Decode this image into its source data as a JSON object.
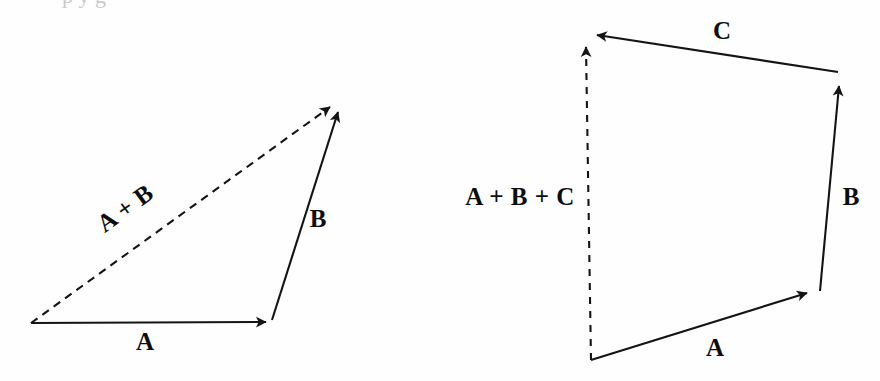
{
  "figure": {
    "width": 880,
    "height": 381,
    "background_color": "#fefefe",
    "ink_color": "#141414",
    "cropped_caption_fragment": "p                  y      g"
  },
  "diagrams": [
    {
      "id": "triangle-sum",
      "name": "two-vector-addition-triangle",
      "description": "Triangle showing head-to-tail addition of vectors A and B with resultant A + B shown as a dashed arrow",
      "vectors": [
        {
          "label": "A",
          "style": "solid",
          "from": [
            31,
            323
          ],
          "to": [
            272,
            322
          ],
          "label_pos": [
            145,
            341
          ],
          "label_rotation": 0
        },
        {
          "label": "B",
          "style": "solid",
          "from": [
            272,
            320
          ],
          "to": [
            342,
            100
          ],
          "label_pos": [
            318,
            218
          ],
          "label_rotation": 0
        },
        {
          "label": "A + B",
          "style": "dashed",
          "from": [
            31,
            323
          ],
          "to": [
            338,
            101
          ],
          "label_pos": [
            125,
            208
          ],
          "label_rotation": -36
        }
      ]
    },
    {
      "id": "quadrilateral-sum",
      "name": "three-vector-addition-polygon",
      "description": "Closed polygon showing head-to-tail addition of vectors A, B and C with resultant A + B + C shown as a dashed vertical arrow",
      "vectors": [
        {
          "label": "A",
          "style": "solid",
          "from": [
            591,
            360
          ],
          "to": [
            815,
            290
          ],
          "label_pos": [
            715,
            347
          ],
          "label_rotation": 0
        },
        {
          "label": "B",
          "style": "solid",
          "from": [
            820,
            291
          ],
          "to": [
            840,
            74
          ],
          "label_pos": [
            851,
            196
          ],
          "label_rotation": 0
        },
        {
          "label": "C",
          "style": "solid",
          "from": [
            838,
            72
          ],
          "to": [
            587,
            34
          ],
          "label_pos": [
            722,
            30
          ],
          "label_rotation": 0
        },
        {
          "label": "A + B + C",
          "style": "dashed",
          "from": [
            591,
            360
          ],
          "to": [
            586,
            36
          ],
          "label_pos": [
            520,
            196
          ],
          "label_rotation": 0
        }
      ]
    }
  ],
  "labels": {
    "left_a": "A",
    "left_b": "B",
    "left_sum": "A + B",
    "right_a": "A",
    "right_b": "B",
    "right_c": "C",
    "right_sum": "A + B + C"
  }
}
